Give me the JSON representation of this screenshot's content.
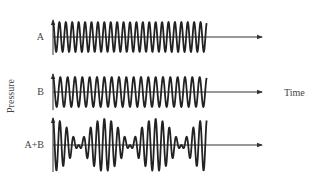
{
  "diagram": {
    "y_axis_label": "Pressure",
    "x_axis_label": "Time",
    "colors": {
      "line": "#222222",
      "axis": "#333333",
      "text": "#444444",
      "background": "#ffffff"
    },
    "plots": [
      {
        "id": "A",
        "label": "A",
        "baseline_y": 37,
        "amplitude": 15,
        "cycles": 24,
        "description": "pure tone, slightly higher frequency"
      },
      {
        "id": "B",
        "label": "B",
        "baseline_y": 92,
        "amplitude": 15,
        "cycles": 21,
        "description": "pure tone, slightly lower frequency"
      },
      {
        "id": "AB",
        "label": "A+B",
        "baseline_y": 145,
        "amplitude": 15,
        "description": "sum of A and B showing beat pattern (about 3 beats)"
      }
    ],
    "x_start": 53,
    "x_wave_end": 207,
    "x_arrow_end": 262
  }
}
